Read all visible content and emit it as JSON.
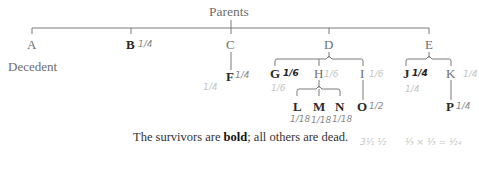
{
  "diagram": {
    "title": "Parents",
    "decedent_label": "Decedent",
    "nodes": {
      "A": {
        "label": "A",
        "survivor": false
      },
      "B": {
        "label": "B",
        "survivor": true
      },
      "C": {
        "label": "C",
        "survivor": false
      },
      "D": {
        "label": "D",
        "survivor": false
      },
      "E": {
        "label": "E",
        "survivor": false
      },
      "F": {
        "label": "F",
        "survivor": true
      },
      "G": {
        "label": "G",
        "survivor": true
      },
      "H": {
        "label": "H",
        "survivor": false
      },
      "I": {
        "label": "I",
        "survivor": false
      },
      "J": {
        "label": "J",
        "survivor": true
      },
      "K": {
        "label": "K",
        "survivor": false
      },
      "L": {
        "label": "L",
        "survivor": true
      },
      "M": {
        "label": "M",
        "survivor": true
      },
      "N": {
        "label": "N",
        "survivor": true
      },
      "O": {
        "label": "O",
        "survivor": true
      },
      "P": {
        "label": "P",
        "survivor": true
      }
    },
    "edges": [
      [
        "Parents",
        "A"
      ],
      [
        "Parents",
        "B"
      ],
      [
        "Parents",
        "C"
      ],
      [
        "Parents",
        "D"
      ],
      [
        "Parents",
        "E"
      ],
      [
        "C",
        "F"
      ],
      [
        "D",
        "G"
      ],
      [
        "D",
        "H"
      ],
      [
        "D",
        "I"
      ],
      [
        "E",
        "J"
      ],
      [
        "E",
        "K"
      ],
      [
        "H",
        "L"
      ],
      [
        "H",
        "M"
      ],
      [
        "H",
        "N"
      ],
      [
        "I",
        "O"
      ],
      [
        "K",
        "P"
      ]
    ],
    "caption": {
      "prefix": "The survivors are ",
      "bold": "bold",
      "suffix": "; all others are dead."
    },
    "handwritten_annotations": {
      "B": "1/4",
      "C": "1/4",
      "F": "1/4",
      "G": "1/6",
      "G_below": "1/6",
      "H": "1/6",
      "I": "1/6",
      "J": "1/4",
      "J_below": "1/4",
      "K": "1/4",
      "L": "1/18",
      "M": "1/18",
      "N": "1/18",
      "O": "1/2",
      "P": "1/4",
      "calc_1": "3¹⁄₁ ¹⁄₂",
      "calc_2": "¹⁄₃ × ¹⁄₃ = ¹⁄₂₄"
    }
  }
}
